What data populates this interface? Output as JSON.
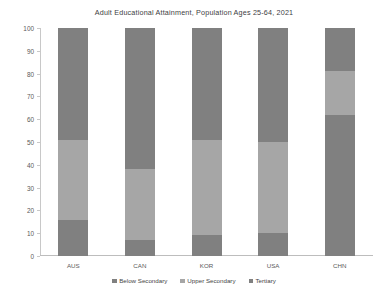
{
  "chart_data": {
    "type": "bar",
    "subtype": "stacked-100-percent",
    "title": "Adult Educational Attainment, Population Ages 25-64, 2021",
    "xlabel": "",
    "ylabel": "",
    "ylim": [
      0,
      100
    ],
    "yticks": [
      0,
      10,
      20,
      30,
      40,
      50,
      60,
      70,
      80,
      90,
      100
    ],
    "ytick_labels": [
      "0",
      "10",
      "20",
      "30",
      "40",
      "50",
      "60",
      "70",
      "80",
      "90",
      "100"
    ],
    "grid": false,
    "legend_position": "bottom",
    "categories": [
      "AUS",
      "CAN",
      "KOR",
      "USA",
      "CHN"
    ],
    "series": [
      {
        "name": "Below Secondary",
        "color": "#808080",
        "values": [
          16,
          7,
          9,
          10,
          62
        ]
      },
      {
        "name": "Upper Secondary",
        "color": "#a6a6a6",
        "values": [
          35,
          31,
          42,
          40,
          19
        ]
      },
      {
        "name": "Tertiary",
        "color": "#808080",
        "values": [
          49,
          62,
          49,
          50,
          19
        ]
      }
    ]
  },
  "legend": {
    "items": [
      {
        "label": "Below Secondary",
        "color": "#808080"
      },
      {
        "label": "Upper Secondary",
        "color": "#a6a6a6"
      },
      {
        "label": "Tertiary",
        "color": "#808080"
      }
    ]
  }
}
